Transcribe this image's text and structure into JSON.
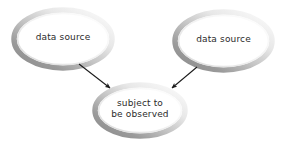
{
  "diagram": {
    "type": "flow-diagram",
    "background_color": "#ffffff",
    "node_fill_color": "#ffffff",
    "node_ring_dark_color": "#8c8c8c",
    "node_ring_light_color": "#fbfbfb",
    "node_shadow_color": "#c9c9c9",
    "arrow_color": "#1a1a1a",
    "text_color": "#2b2b2b",
    "nodes": [
      {
        "id": "source-left",
        "shape": "ellipse",
        "label": "data source",
        "lines": [
          "data source"
        ],
        "cx": 63,
        "cy": 39,
        "rx": 49,
        "ry": 29
      },
      {
        "id": "source-right",
        "shape": "ellipse",
        "label": "data source",
        "lines": [
          "data source"
        ],
        "cx": 223.5,
        "cy": 41,
        "rx": 48.5,
        "ry": 29
      },
      {
        "id": "subject",
        "shape": "ellipse",
        "label": "subject to be observed",
        "lines": [
          "subject to",
          "be observed"
        ],
        "cx": 140,
        "cy": 110.5,
        "rx": 45,
        "ry": 25.5
      }
    ],
    "edges": [
      {
        "id": "edge-left",
        "from": "source-left",
        "to": "subject",
        "x1": 79,
        "y1": 64,
        "x2": 110,
        "y2": 88,
        "arrowhead": "filled-triangle"
      },
      {
        "id": "edge-right",
        "from": "source-right",
        "to": "subject",
        "x1": 197,
        "y1": 67,
        "x2": 172,
        "y2": 88,
        "arrowhead": "filled-triangle"
      }
    ]
  }
}
